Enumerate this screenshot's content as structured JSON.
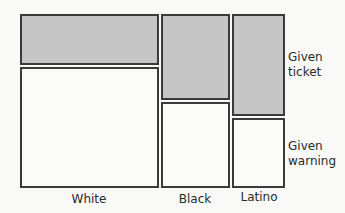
{
  "diagram": {
    "type": "mosaic_plot",
    "colors": {
      "ticket_fill": "#c6c6c6",
      "warning_fill": "#fbfbfa",
      "border": "#3a3a3a"
    },
    "columns": [
      {
        "label": "White",
        "x": 20,
        "width": 139,
        "ticket": {
          "y": 14,
          "height": 51
        },
        "warning": {
          "y": 67,
          "height": 121
        }
      },
      {
        "label": "Black",
        "x": 161,
        "width": 69,
        "ticket": {
          "y": 14,
          "height": 86
        },
        "warning": {
          "y": 102,
          "height": 86
        }
      },
      {
        "label": "Latino",
        "x": 232,
        "width": 53,
        "ticket": {
          "y": 14,
          "height": 102
        },
        "warning": {
          "y": 118,
          "height": 70
        }
      }
    ],
    "rows": [
      {
        "line1": "Given",
        "line2": "ticket"
      },
      {
        "line1": "Given",
        "line2": "warning"
      }
    ]
  }
}
